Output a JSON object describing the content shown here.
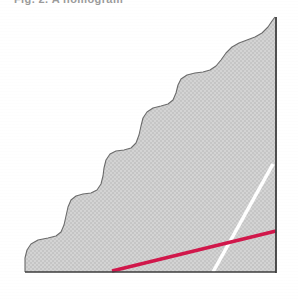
{
  "figure": {
    "caption_clipped": "Fig. 2.  A nomogram",
    "background_color": "#ffffff",
    "width": 298,
    "height": 299
  },
  "axes": {
    "right_axis": {
      "name": "right-vertical-axis",
      "color": "#3c3c3c",
      "x": 276,
      "y_top": 17,
      "y_bottom": 273
    },
    "baseline": {
      "name": "baseline-axis",
      "color": "#3c3c3c",
      "y": 272,
      "x_left": 25,
      "x_right": 276
    }
  },
  "chart_data": {
    "type": "area",
    "title": "",
    "subtitle": "",
    "xlabel": "",
    "ylabel": "",
    "xlim": [
      0,
      298
    ],
    "ylim": [
      299,
      0
    ],
    "grid": false,
    "legend": "none",
    "series": [
      {
        "name": "shaded-region",
        "kind": "area",
        "fill": "#d2d2d2",
        "stroke": "#6b6b6b",
        "texture": "cross-hatch-dither",
        "points": [
          [
            25,
            272
          ],
          [
            25,
            258
          ],
          [
            27,
            250
          ],
          [
            31,
            244
          ],
          [
            38,
            240
          ],
          [
            48,
            238
          ],
          [
            56,
            236
          ],
          [
            61,
            232
          ],
          [
            64,
            225
          ],
          [
            66,
            216
          ],
          [
            68,
            207
          ],
          [
            71,
            200
          ],
          [
            76,
            196
          ],
          [
            83,
            194
          ],
          [
            91,
            193
          ],
          [
            97,
            190
          ],
          [
            101,
            184
          ],
          [
            103,
            176
          ],
          [
            104,
            168
          ],
          [
            106,
            160
          ],
          [
            110,
            154
          ],
          [
            116,
            151
          ],
          [
            124,
            150
          ],
          [
            131,
            148
          ],
          [
            136,
            143
          ],
          [
            139,
            135
          ],
          [
            141,
            126
          ],
          [
            143,
            118
          ],
          [
            147,
            112
          ],
          [
            153,
            108
          ],
          [
            161,
            106
          ],
          [
            168,
            104
          ],
          [
            173,
            100
          ],
          [
            176,
            93
          ],
          [
            178,
            85
          ],
          [
            181,
            79
          ],
          [
            187,
            75
          ],
          [
            195,
            73
          ],
          [
            203,
            72
          ],
          [
            210,
            70
          ],
          [
            216,
            66
          ],
          [
            221,
            60
          ],
          [
            226,
            53
          ],
          [
            232,
            47
          ],
          [
            239,
            43
          ],
          [
            247,
            40
          ],
          [
            255,
            37
          ],
          [
            262,
            33
          ],
          [
            268,
            27
          ],
          [
            272,
            21
          ],
          [
            275,
            17
          ],
          [
            276,
            272
          ]
        ]
      },
      {
        "name": "crimson-trend-line",
        "kind": "line",
        "color": "#d1174b",
        "width": 3.4,
        "x1": 112,
        "y1": 271,
        "x2": 276,
        "y2": 231
      },
      {
        "name": "white-reference-line",
        "kind": "line",
        "color": "#ffffff",
        "width": 3.6,
        "x1": 213,
        "y1": 272,
        "x2": 273,
        "y2": 164
      }
    ]
  }
}
